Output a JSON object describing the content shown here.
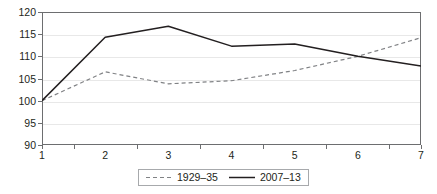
{
  "chart_data": {
    "type": "line",
    "title": "",
    "subtitle": "",
    "xlabel": "",
    "ylabel": "",
    "x": [
      1,
      2,
      3,
      4,
      5,
      6,
      7
    ],
    "categories": [
      "1",
      "2",
      "3",
      "4",
      "5",
      "6",
      "7"
    ],
    "xlim": [
      1,
      7
    ],
    "ylim": [
      90,
      120
    ],
    "y_ticks": [
      90,
      95,
      100,
      105,
      110,
      115,
      120
    ],
    "y_tick_labels": [
      "90",
      "95",
      "100",
      "105",
      "110",
      "115",
      "120"
    ],
    "grid": true,
    "grid_axis": "y",
    "legend_position": "bottom-center",
    "series": [
      {
        "name": "1929–35",
        "style": "dashed",
        "color": "#808285",
        "values": [
          100.0,
          106.5,
          103.8,
          104.5,
          106.8,
          110.0,
          114.2
        ]
      },
      {
        "name": "2007–13",
        "style": "solid",
        "color": "#231f20",
        "values": [
          100.0,
          114.3,
          116.8,
          112.3,
          112.8,
          110.0,
          107.8
        ]
      }
    ]
  },
  "legend": {
    "entries": [
      {
        "label": "1929–35",
        "swatch": "dashed-line-swatch"
      },
      {
        "label": "2007–13",
        "swatch": "solid-line-swatch"
      }
    ]
  },
  "colors": {
    "series_dashed": "#808285",
    "series_solid": "#231f20",
    "axis": "#6d6e70",
    "gridline": "#e8e8e8",
    "legend_border": "#a7a9ac",
    "text": "#231f20",
    "background": "#ffffff"
  }
}
